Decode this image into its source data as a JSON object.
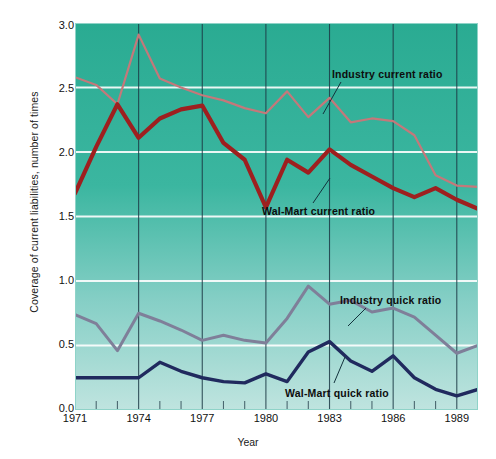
{
  "chart_data": {
    "type": "line",
    "title": "",
    "xlabel": "Year",
    "ylabel": "Coverage of current liabilities, number of times",
    "xlim": [
      1971,
      1990
    ],
    "ylim": [
      0.0,
      3.0
    ],
    "grid": "horizontal white gridlines every 0.5; vertical dark rules at labeled years",
    "legend_position": "inline annotations with leader lines",
    "x": [
      1971,
      1972,
      1973,
      1974,
      1975,
      1976,
      1977,
      1978,
      1979,
      1980,
      1981,
      1982,
      1983,
      1984,
      1985,
      1986,
      1987,
      1988,
      1989,
      1990
    ],
    "xtick_labels": [
      "1971",
      "1974",
      "1977",
      "1980",
      "1983",
      "1986",
      "1989"
    ],
    "xtick_values": [
      1971,
      1974,
      1977,
      1980,
      1983,
      1986,
      1989
    ],
    "ytick_labels": [
      "0.0",
      "0.5",
      "1.0",
      "1.5",
      "2.0",
      "2.5",
      "3.0"
    ],
    "ytick_values": [
      0.0,
      0.5,
      1.0,
      1.5,
      2.0,
      2.5,
      3.0
    ],
    "series": [
      {
        "name": "Industry current ratio",
        "color": "#c4787a",
        "width": 2.2,
        "values": [
          2.58,
          2.52,
          2.37,
          2.91,
          2.57,
          2.5,
          2.44,
          2.4,
          2.34,
          2.3,
          2.47,
          2.27,
          2.42,
          2.23,
          2.26,
          2.24,
          2.13,
          1.82,
          1.74,
          1.73
        ]
      },
      {
        "name": "Wal-Mart current ratio",
        "color": "#9e1f1f",
        "width": 4.2,
        "values": [
          1.68,
          2.04,
          2.37,
          2.11,
          2.26,
          2.33,
          2.36,
          2.07,
          1.94,
          1.57,
          1.94,
          1.84,
          2.02,
          1.9,
          1.81,
          1.72,
          1.65,
          1.72,
          1.63,
          1.56
        ]
      },
      {
        "name": "Industry quick ratio",
        "color": "#7f7f99",
        "width": 3.0,
        "values": [
          0.74,
          0.67,
          0.46,
          0.75,
          0.69,
          0.62,
          0.54,
          0.58,
          0.54,
          0.52,
          0.71,
          0.96,
          0.82,
          0.85,
          0.76,
          0.79,
          0.72,
          0.58,
          0.44,
          0.5
        ]
      },
      {
        "name": "Wal-Mart quick ratio",
        "color": "#202a5e",
        "width": 3.4,
        "values": [
          0.25,
          0.25,
          0.25,
          0.25,
          0.37,
          0.3,
          0.25,
          0.22,
          0.21,
          0.28,
          0.22,
          0.45,
          0.53,
          0.38,
          0.3,
          0.42,
          0.25,
          0.16,
          0.11,
          0.16
        ]
      }
    ],
    "annotations": [
      {
        "text": "Industry current ratio",
        "x": 332,
        "y": 68,
        "lx1": 341,
        "ly1": 82,
        "lx2": 323,
        "ly2": 114
      },
      {
        "text": "Wal-Mart current ratio",
        "x": 262,
        "y": 205,
        "lx1": 313,
        "ly1": 203,
        "lx2": 330,
        "ly2": 178
      },
      {
        "text": "Industry quick ratio",
        "x": 340,
        "y": 294,
        "lx1": 366,
        "ly1": 308,
        "lx2": 348,
        "ly2": 326
      },
      {
        "text": "Wal-Mart quick ratio",
        "x": 285,
        "y": 387,
        "lx1": 334,
        "ly1": 383,
        "lx2": 345,
        "ly2": 357
      }
    ]
  },
  "theme": {
    "plot_bg_top": "#2aab92",
    "plot_bg_bottom": "#b9e1dc",
    "gridline_color": "#ffffff",
    "vrule_color": "#1d3a46",
    "page_bg": "#ffffff"
  }
}
